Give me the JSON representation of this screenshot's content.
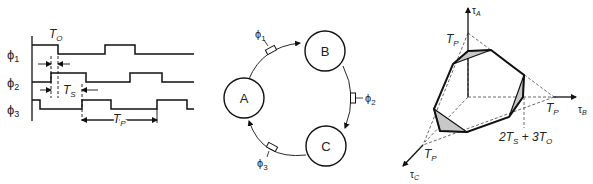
{
  "figure": {
    "panels": [
      {
        "id": "timing",
        "signals": [
          {
            "label": "ϕ",
            "sub": "1"
          },
          {
            "label": "ϕ",
            "sub": "2"
          },
          {
            "label": "ϕ",
            "sub": "3"
          }
        ],
        "annotations": {
          "t_o": {
            "main": "T",
            "sub": "O"
          },
          "t_s": {
            "main": "T",
            "sub": "S"
          },
          "t_p": {
            "main": "T",
            "sub": "P"
          }
        }
      },
      {
        "id": "ring",
        "nodes": [
          "A",
          "B",
          "C"
        ],
        "clocks": [
          {
            "label": "ϕ",
            "sub": "1"
          },
          {
            "label": "ϕ",
            "sub": "2"
          },
          {
            "label": "ϕ",
            "sub": "3"
          }
        ]
      },
      {
        "id": "polytope",
        "axes": [
          {
            "main": "τ",
            "sub": "A"
          },
          {
            "main": "τ",
            "sub": "B"
          },
          {
            "main": "τ",
            "sub": "C"
          }
        ],
        "intercepts": [
          {
            "main": "T",
            "sub": "P"
          },
          {
            "main": "T",
            "sub": "P"
          },
          {
            "main": "T",
            "sub": "P"
          }
        ],
        "bound": {
          "a": "2T",
          "a_sub": "S",
          "plus": " + ",
          "b": "3T",
          "b_sub": "O"
        }
      }
    ]
  }
}
